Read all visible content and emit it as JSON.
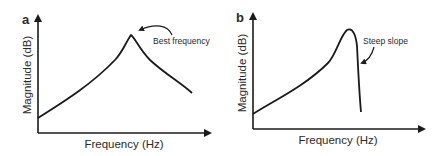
{
  "figure": {
    "panels": [
      {
        "id": "a",
        "label": "a",
        "xlabel": "Frequency (Hz)",
        "ylabel": "Magnitude (dB)",
        "annotation": "Best frequency",
        "curve_description": "Rises gradually to a peak, then falls off gradually"
      },
      {
        "id": "b",
        "label": "b",
        "xlabel": "Frequency (Hz)",
        "ylabel": "Magnitude (dB)",
        "annotation": "Steep slope",
        "curve_description": "Rises gradually to a peak, then drops off steeply"
      }
    ]
  },
  "colors": {
    "line": "#1a1a1a",
    "text": "#2a2a2a",
    "background": "#ffffff"
  }
}
